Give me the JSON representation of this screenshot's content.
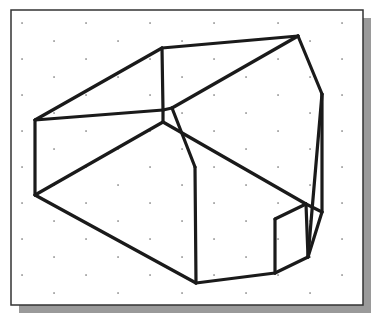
{
  "figure": {
    "title": "",
    "frame": {
      "x": 11,
      "y": 10,
      "width": 352,
      "height": 295,
      "border_color": "#333333",
      "shadow_color": "#9a9a9a",
      "shadow_offset": 8
    },
    "grid": {
      "dot_color": "#555555",
      "origin_x": 22,
      "origin_y": 23,
      "dx": 64,
      "dy": 18,
      "row_offset": 32,
      "cols": 6,
      "rows": 16
    },
    "stroke": {
      "color": "#1a1a1a",
      "width": 3.2
    },
    "vertices": {
      "A": [
        35,
        120
      ],
      "B": [
        35,
        195
      ],
      "C": [
        162,
        48
      ],
      "D": [
        298,
        36
      ],
      "E": [
        322,
        94
      ],
      "F": [
        163,
        110
      ],
      "G": [
        172,
        108
      ],
      "H": [
        163,
        122
      ],
      "I": [
        195,
        167
      ],
      "J": [
        196,
        283
      ],
      "K": [
        275,
        273
      ],
      "L": [
        275,
        219
      ],
      "M": [
        306,
        204
      ],
      "N": [
        322,
        212
      ],
      "O": [
        308,
        257
      ]
    },
    "edges": [
      [
        "A",
        "B"
      ],
      [
        "A",
        "C"
      ],
      [
        "A",
        "F"
      ],
      [
        "C",
        "D"
      ],
      [
        "C",
        "F"
      ],
      [
        "D",
        "E"
      ],
      [
        "D",
        "G"
      ],
      [
        "F",
        "G"
      ],
      [
        "F",
        "H"
      ],
      [
        "H",
        "B"
      ],
      [
        "G",
        "I"
      ],
      [
        "H",
        "M"
      ],
      [
        "I",
        "J"
      ],
      [
        "B",
        "J"
      ],
      [
        "J",
        "K"
      ],
      [
        "K",
        "L"
      ],
      [
        "L",
        "M"
      ],
      [
        "M",
        "N"
      ],
      [
        "E",
        "N"
      ],
      [
        "E",
        "O"
      ],
      [
        "N",
        "O"
      ],
      [
        "K",
        "O"
      ],
      [
        "M",
        "O"
      ]
    ]
  }
}
